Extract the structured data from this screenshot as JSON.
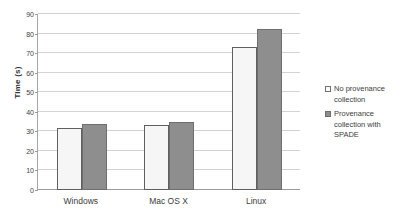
{
  "chart_data": {
    "type": "bar",
    "title": "",
    "subtitle": "",
    "xlabel": "",
    "ylabel": "Time (s)",
    "categories": [
      "Windows",
      "Mac OS X",
      "Linux"
    ],
    "series": [
      {
        "name": "No provenance collection",
        "values": [
          31.5,
          33,
          73
        ],
        "color": "#f6f6f6"
      },
      {
        "name": "Provenance collection with SPADE",
        "values": [
          34,
          35,
          82.5
        ],
        "color": "#8e8e8e"
      }
    ],
    "ylim": [
      0,
      90
    ],
    "yticks": [
      0,
      10,
      20,
      30,
      40,
      50,
      60,
      70,
      80,
      90
    ],
    "ytick_labels": [
      "0",
      "10",
      "20",
      "30",
      "40",
      "50",
      "60",
      "70",
      "80",
      "90"
    ],
    "grid": "horizontal",
    "legend_position": "right",
    "legend_entries": [
      "No provenance collection",
      "Provenance collection with SPADE"
    ]
  }
}
